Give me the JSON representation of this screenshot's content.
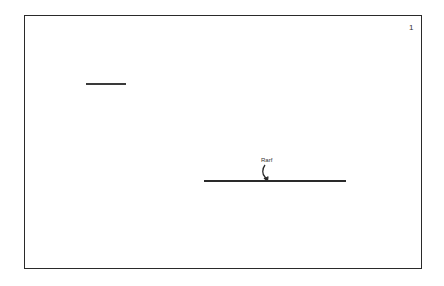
{
  "diagram": {
    "page_number": "1",
    "annotation": {
      "label": "Rarf"
    },
    "elements": [
      {
        "type": "line",
        "name": "short-line",
        "x1": 86,
        "y1": 83,
        "x2": 126,
        "y2": 83
      },
      {
        "type": "line",
        "name": "long-line",
        "x1": 204,
        "y1": 180,
        "x2": 346,
        "y2": 180
      }
    ],
    "colors": {
      "stroke": "#2a2a2a",
      "background": "#ffffff"
    }
  }
}
